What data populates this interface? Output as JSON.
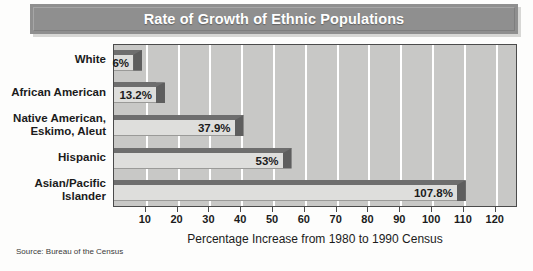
{
  "chart_data": {
    "type": "bar",
    "orientation": "horizontal",
    "title": "Rate of Growth of Ethnic Populations",
    "xlabel": "Percentage Increase from 1980 to 1990 Census",
    "ylabel": "",
    "categories": [
      "White",
      "African American",
      "Native American,\nEskimo, Aleut",
      "Hispanic",
      "Asian/Pacific\nIslander"
    ],
    "values": [
      6,
      13.2,
      37.9,
      53,
      107.8
    ],
    "value_labels": [
      "6%",
      "13.2%",
      "37.9%",
      "53%",
      "107.8%"
    ],
    "xlim": [
      0,
      127
    ],
    "xticks": [
      10,
      20,
      30,
      40,
      50,
      60,
      70,
      80,
      90,
      100,
      110,
      120
    ],
    "xtick_labels": [
      "10",
      "20",
      "30",
      "40",
      "50",
      "60",
      "70",
      "80",
      "90",
      "100",
      "110",
      "120"
    ],
    "grid": "vertical-white-gridlines",
    "legend": null,
    "source": "Source: Bureau of the Census",
    "colors": {
      "plot_background": "#c8c8c6",
      "bar_face": "#dededc",
      "bar_shade": "#6e6e6e",
      "title_banner": "#8f8f8f",
      "title_text": "#ffffff",
      "gridline": "#ffffff",
      "axis": "#4b4b4b"
    }
  }
}
